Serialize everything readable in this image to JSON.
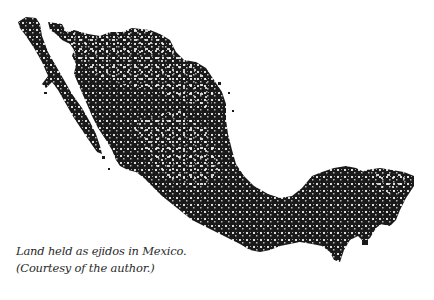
{
  "figure": {
    "ink_color": "#1a1a1a",
    "caption": {
      "line1": "Land held as ejidos in Mexico.",
      "line2": "(Courtesy of the author.)"
    }
  }
}
